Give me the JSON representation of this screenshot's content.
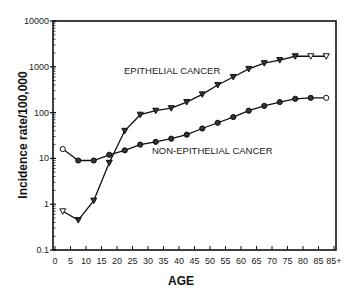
{
  "chart_data": {
    "type": "line",
    "title": "",
    "xlabel": "AGE",
    "ylabel": "Incidence rate/100,000",
    "yscale": "log",
    "ylim": [
      0.1,
      10000
    ],
    "y_ticks": [
      "0.1",
      "1",
      "10",
      "100",
      "1000",
      "10000"
    ],
    "x_tick_labels": [
      "0",
      "5",
      "10",
      "15",
      "20",
      "25",
      "30",
      "35",
      "40",
      "45",
      "50",
      "55",
      "60",
      "65",
      "70",
      "75",
      "80",
      "85",
      "85+"
    ],
    "x": [
      2.5,
      7.5,
      12.5,
      17.5,
      22.5,
      27.5,
      32.5,
      37.5,
      42.5,
      47.5,
      52.5,
      57.5,
      62.5,
      67.5,
      72.5,
      77.5,
      82.5,
      87.5
    ],
    "grid": false,
    "legend": "none (inline annotations)",
    "annotations": [
      {
        "text": "EPITHELIAL CANCER",
        "near_series": "Epithelial cancer"
      },
      {
        "text": "NON-EPITHELIAL CANCER",
        "near_series": "Non-epithelial cancer"
      }
    ],
    "series": [
      {
        "name": "Epithelial cancer",
        "marker": "triangle-down",
        "values": [
          0.7,
          0.45,
          1.2,
          8,
          40,
          90,
          110,
          125,
          170,
          250,
          400,
          600,
          900,
          1200,
          1400,
          1700,
          1700,
          1700
        ]
      },
      {
        "name": "Non-epithelial cancer",
        "marker": "circle",
        "values": [
          16,
          9,
          9,
          12,
          15,
          20,
          23,
          27,
          33,
          45,
          60,
          80,
          110,
          140,
          170,
          200,
          210,
          210
        ]
      }
    ]
  }
}
